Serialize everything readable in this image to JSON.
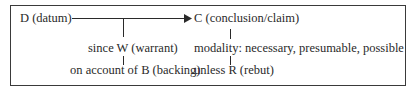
{
  "diagram": {
    "nodes": {
      "datum": "D (datum)",
      "claim": "C (conclusion/claim)",
      "warrant": "since W (warrant)",
      "backing": "on account of B (backing)",
      "modality": "modality: necessary, presumable, possible",
      "rebuttal": "unless R (rebut)"
    },
    "edges": [
      {
        "from": "datum",
        "to": "claim",
        "type": "arrow"
      },
      {
        "from": "warrant",
        "to": "datum-claim-arrow",
        "type": "line"
      },
      {
        "from": "backing",
        "to": "warrant",
        "type": "line"
      },
      {
        "from": "claim",
        "to": "modality",
        "type": "line"
      },
      {
        "from": "modality",
        "to": "rebuttal",
        "type": "line"
      }
    ]
  }
}
